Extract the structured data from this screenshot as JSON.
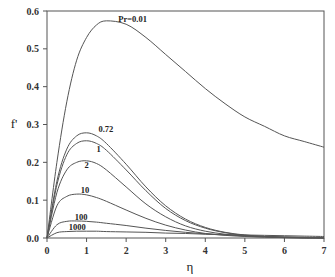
{
  "chart_data": {
    "type": "line",
    "title": "",
    "xlabel": "η",
    "ylabel": "f'",
    "xlim": [
      0,
      7
    ],
    "ylim": [
      0.0,
      0.6
    ],
    "xticks": [
      "0",
      "1",
      "2",
      "3",
      "4",
      "5",
      "6",
      "7"
    ],
    "yticks": [
      "0.0",
      "0.1",
      "0.2",
      "0.3",
      "0.4",
      "0.5",
      "0.6"
    ],
    "grid": false,
    "legend": "inline curve labels",
    "x": [
      0,
      0.25,
      0.5,
      0.75,
      1.0,
      1.25,
      1.5,
      2.0,
      2.5,
      3.0,
      3.5,
      4.0,
      4.5,
      5.0,
      5.5,
      6.0,
      6.5,
      7.0
    ],
    "series": [
      {
        "name": "Pr=0.01",
        "label": "Pr=0.01",
        "values": [
          0.0,
          0.2,
          0.36,
          0.47,
          0.53,
          0.563,
          0.574,
          0.565,
          0.53,
          0.485,
          0.44,
          0.395,
          0.355,
          0.32,
          0.295,
          0.27,
          0.255,
          0.24
        ]
      },
      {
        "name": "0.72",
        "label": "0.72",
        "values": [
          0.0,
          0.15,
          0.235,
          0.27,
          0.278,
          0.27,
          0.25,
          0.195,
          0.135,
          0.085,
          0.05,
          0.028,
          0.015,
          0.008,
          0.004,
          0.002,
          0.001,
          0.0
        ]
      },
      {
        "name": "1",
        "label": "1",
        "values": [
          0.0,
          0.14,
          0.22,
          0.25,
          0.257,
          0.25,
          0.232,
          0.18,
          0.125,
          0.078,
          0.046,
          0.026,
          0.014,
          0.007,
          0.004,
          0.002,
          0.001,
          0.0
        ]
      },
      {
        "name": "2",
        "label": "2",
        "values": [
          0.0,
          0.12,
          0.18,
          0.2,
          0.204,
          0.197,
          0.18,
          0.135,
          0.09,
          0.056,
          0.032,
          0.018,
          0.01,
          0.005,
          0.003,
          0.001,
          0.0,
          0.0
        ]
      },
      {
        "name": "10",
        "label": "10",
        "values": [
          0.0,
          0.085,
          0.11,
          0.116,
          0.114,
          0.107,
          0.097,
          0.074,
          0.052,
          0.034,
          0.021,
          0.012,
          0.007,
          0.004,
          0.002,
          0.001,
          0.0,
          0.0
        ]
      },
      {
        "name": "100",
        "label": "100",
        "values": [
          0.0,
          0.035,
          0.044,
          0.045,
          0.044,
          0.042,
          0.039,
          0.033,
          0.026,
          0.02,
          0.015,
          0.011,
          0.008,
          0.006,
          0.004,
          0.003,
          0.002,
          0.001
        ]
      },
      {
        "name": "1000",
        "label": "1000",
        "values": [
          0.0,
          0.014,
          0.017,
          0.018,
          0.018,
          0.018,
          0.017,
          0.016,
          0.015,
          0.013,
          0.012,
          0.01,
          0.009,
          0.008,
          0.007,
          0.006,
          0.005,
          0.004
        ]
      }
    ],
    "label_positions": [
      {
        "text": "Pr=0.01",
        "x": 1.8,
        "y": 0.57
      },
      {
        "text": "0.72",
        "x": 1.3,
        "y": 0.28
      },
      {
        "text": "1",
        "x": 1.25,
        "y": 0.228
      },
      {
        "text": "2",
        "x": 0.95,
        "y": 0.185
      },
      {
        "text": "10",
        "x": 0.85,
        "y": 0.118
      },
      {
        "text": "100",
        "x": 0.7,
        "y": 0.047
      },
      {
        "text": "1000",
        "x": 0.55,
        "y": 0.02
      }
    ]
  }
}
